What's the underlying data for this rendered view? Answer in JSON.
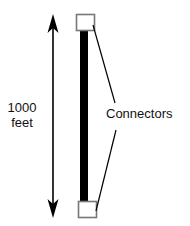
{
  "diagram": {
    "distance_label": {
      "line1": "1000",
      "line2": "feet"
    },
    "connector_label": "Connectors",
    "top_cut_text": "",
    "colors": {
      "cable": "#000000",
      "connector_stroke": "#777777",
      "connector_fill": "#ffffff",
      "arrow": "#000000"
    },
    "parts": [
      "top-connector",
      "cable",
      "bottom-connector",
      "double-arrow"
    ]
  }
}
